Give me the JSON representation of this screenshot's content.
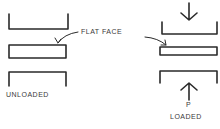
{
  "diagram": {
    "labels": {
      "flat_face": "FLAT FACE",
      "unloaded": "UNLOADED",
      "load_symbol": "P",
      "loaded": "LOADED"
    },
    "colors": {
      "stroke": "#2a2a2a",
      "text": "#3a3a3a",
      "background": "#ffffff"
    }
  }
}
